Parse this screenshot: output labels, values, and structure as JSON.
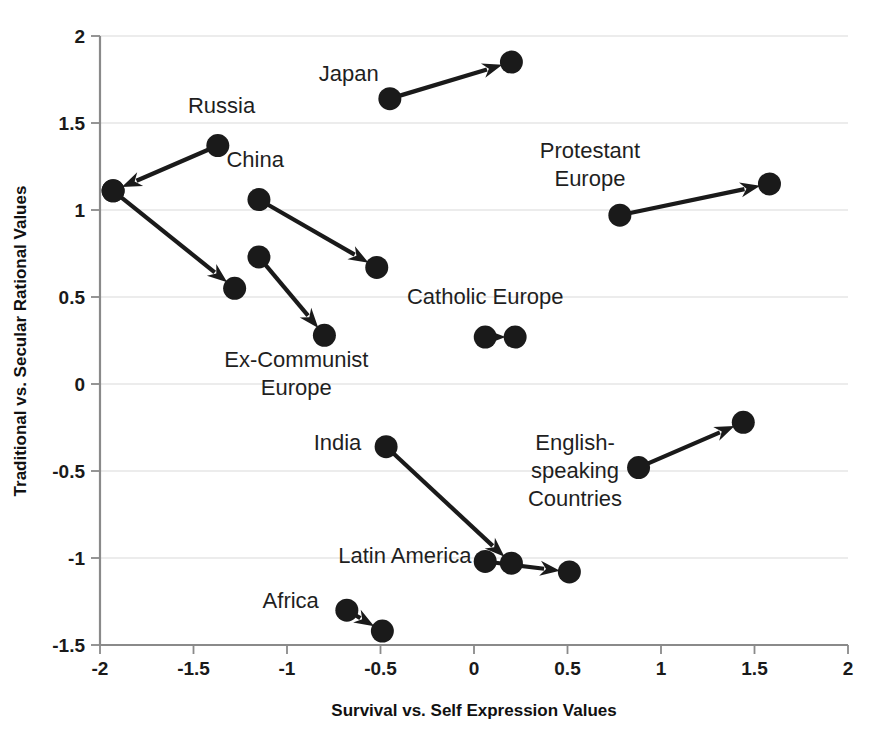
{
  "chart_data": {
    "type": "scatter",
    "title": "",
    "subtitle": "",
    "xlabel": "Survival vs. Self Expression Values",
    "ylabel": "Traditional vs. Secular Rational Values",
    "xlim": [
      -2,
      2
    ],
    "ylim": [
      -1.5,
      2
    ],
    "xticks": [
      "-2",
      "-1.5",
      "-1",
      "-0.5",
      "0",
      "0.5",
      "1",
      "1.5",
      "2"
    ],
    "xtick_values": [
      -2,
      -1.5,
      -1,
      -0.5,
      0,
      0.5,
      1,
      1.5,
      2
    ],
    "yticks": [
      "-1.5",
      "-1",
      "-0.5",
      "0",
      "0.5",
      "1",
      "1.5",
      "2"
    ],
    "ytick_values": [
      -1.5,
      -1,
      -0.5,
      0,
      0.5,
      1,
      1.5,
      2
    ],
    "grid": "horizontal",
    "legend": "none",
    "marker_color": "#1a1a1a",
    "gridline_color": "#d9d9d9",
    "axis_color": "#8a8a8a",
    "series": [
      {
        "name": "Japan",
        "label": "Japan",
        "label_x": -0.67,
        "label_y": 1.74,
        "label_lines": [
          "Japan"
        ],
        "from": [
          -0.45,
          1.64
        ],
        "to": [
          0.2,
          1.85
        ]
      },
      {
        "name": "Russia",
        "label": "Russia",
        "label_x": -1.35,
        "label_y": 1.56,
        "label_lines": [
          "Russia"
        ],
        "from": [
          -1.37,
          1.37
        ],
        "to": [
          -1.93,
          1.11
        ]
      },
      {
        "name": "Ex-Communist Europe A",
        "label": "",
        "label_x": null,
        "label_y": null,
        "label_lines": [],
        "from": [
          -1.93,
          1.11
        ],
        "to": [
          -1.28,
          0.55
        ]
      },
      {
        "name": "Ex-Communist Europe B",
        "label": "Ex-Communist Europe",
        "label_x": -0.95,
        "label_y": 0.1,
        "label_lines": [
          "Ex-Communist",
          "Europe"
        ],
        "from": [
          -1.15,
          0.73
        ],
        "to": [
          -0.8,
          0.28
        ]
      },
      {
        "name": "China",
        "label": "China",
        "label_x": -1.17,
        "label_y": 1.25,
        "label_lines": [
          "China"
        ],
        "from": [
          -1.15,
          1.06
        ],
        "to": [
          -0.52,
          0.67
        ]
      },
      {
        "name": "Protestant Europe",
        "label": "Protestant Europe",
        "label_x": 0.62,
        "label_y": 1.3,
        "label_lines": [
          "Protestant",
          "Europe"
        ],
        "from": [
          0.78,
          0.97
        ],
        "to": [
          1.58,
          1.15
        ]
      },
      {
        "name": "Catholic Europe",
        "label": "Catholic Europe",
        "label_x": 0.06,
        "label_y": 0.46,
        "label_lines": [
          "Catholic Europe"
        ],
        "from": [
          0.06,
          0.27
        ],
        "to": [
          0.22,
          0.27
        ]
      },
      {
        "name": "English-speaking Countries",
        "label": "English-speaking Countries",
        "label_x": 0.54,
        "label_y": -0.38,
        "label_lines": [
          "English-",
          "speaking",
          "Countries"
        ],
        "from": [
          0.88,
          -0.48
        ],
        "to": [
          1.44,
          -0.22
        ]
      },
      {
        "name": "India",
        "label": "India",
        "label_x": -0.73,
        "label_y": -0.38,
        "label_lines": [
          "India"
        ],
        "from": [
          -0.47,
          -0.36
        ],
        "to": [
          0.2,
          -1.03
        ]
      },
      {
        "name": "Latin America",
        "label": "Latin America",
        "label_x": -0.37,
        "label_y": -1.03,
        "label_lines": [
          "Latin America"
        ],
        "from": [
          0.06,
          -1.02
        ],
        "to": [
          0.51,
          -1.08
        ]
      },
      {
        "name": "Africa",
        "label": "Africa",
        "label_x": -0.98,
        "label_y": -1.29,
        "label_lines": [
          "Africa"
        ],
        "from": [
          -0.68,
          -1.3
        ],
        "to": [
          -0.49,
          -1.42
        ]
      }
    ]
  },
  "axes": {
    "x_title": "Survival vs. Self Expression Values",
    "y_title": "Traditional vs. Secular Rational Values"
  }
}
